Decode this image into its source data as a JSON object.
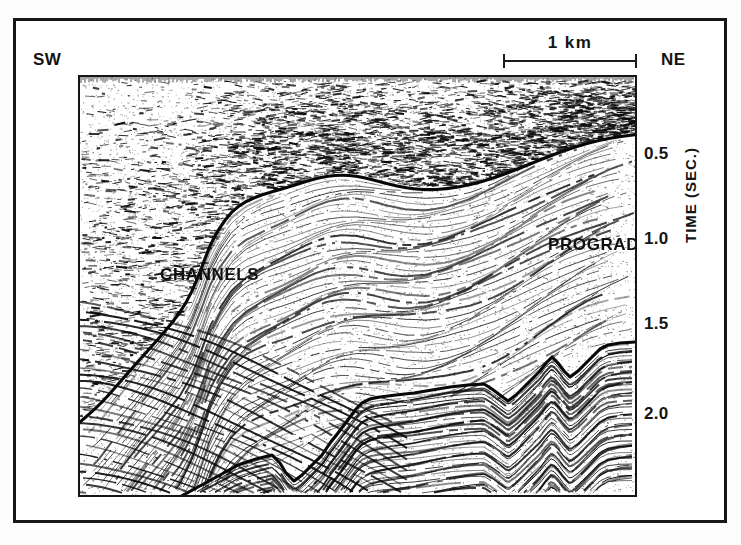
{
  "figure": {
    "type": "seismic-reflection-profile",
    "orientation": {
      "left_label": "SW",
      "right_label": "NE"
    },
    "scalebar": {
      "label": "1 km",
      "length_km": 1
    },
    "axis": {
      "title": "TIME (SEC.)",
      "unit": "SEC.",
      "ticks": [
        {
          "label": "0.5",
          "value": 0.5,
          "y": 80
        },
        {
          "label": "1.0",
          "value": 1.0,
          "y": 165
        },
        {
          "label": "1.5",
          "value": 1.5,
          "y": 250
        },
        {
          "label": "2.0",
          "value": 2.0,
          "y": 340
        }
      ]
    },
    "annotations": [
      {
        "label": "CHANNELS",
        "x": 2,
        "y": 113
      },
      {
        "label": "PROGRADING",
        "x": 390,
        "y": 83
      },
      {
        "label": "TURBIDITES",
        "x": 419,
        "y": 349
      }
    ],
    "horizons": [
      {
        "name": "upper-horizon",
        "style": "smooth",
        "points": [
          [
            0,
            345
          ],
          [
            18,
            330
          ],
          [
            40,
            305
          ],
          [
            62,
            280
          ],
          [
            82,
            258
          ],
          [
            100,
            236
          ],
          [
            112,
            215
          ],
          [
            122,
            190
          ],
          [
            130,
            168
          ],
          [
            140,
            150
          ],
          [
            152,
            134
          ],
          [
            166,
            124
          ],
          [
            184,
            117
          ],
          [
            202,
            112
          ],
          [
            218,
            107
          ],
          [
            234,
            102
          ],
          [
            248,
            99
          ],
          [
            262,
            98
          ],
          [
            276,
            99
          ],
          [
            290,
            102
          ],
          [
            308,
            107
          ],
          [
            326,
            111
          ],
          [
            346,
            113
          ],
          [
            366,
            112
          ],
          [
            390,
            108
          ],
          [
            414,
            101
          ],
          [
            438,
            92
          ],
          [
            462,
            82
          ],
          [
            486,
            73
          ],
          [
            508,
            66
          ],
          [
            530,
            61
          ],
          [
            552,
            58
          ],
          [
            559,
            57
          ]
        ]
      },
      {
        "name": "lower-horizon",
        "style": "zigzag",
        "points": [
          [
            96,
            422
          ],
          [
            118,
            410
          ],
          [
            140,
            398
          ],
          [
            158,
            388
          ],
          [
            176,
            382
          ],
          [
            192,
            378
          ],
          [
            200,
            386
          ],
          [
            206,
            396
          ],
          [
            214,
            404
          ],
          [
            222,
            398
          ],
          [
            232,
            388
          ],
          [
            242,
            378
          ],
          [
            250,
            366
          ],
          [
            258,
            356
          ],
          [
            264,
            348
          ],
          [
            270,
            340
          ],
          [
            276,
            332
          ],
          [
            282,
            326
          ],
          [
            290,
            322
          ],
          [
            300,
            320
          ],
          [
            316,
            318
          ],
          [
            334,
            316
          ],
          [
            352,
            313
          ],
          [
            370,
            310
          ],
          [
            388,
            308
          ],
          [
            404,
            307
          ],
          [
            412,
            312
          ],
          [
            420,
            318
          ],
          [
            428,
            324
          ],
          [
            436,
            318
          ],
          [
            444,
            310
          ],
          [
            452,
            302
          ],
          [
            460,
            294
          ],
          [
            466,
            286
          ],
          [
            472,
            280
          ],
          [
            478,
            286
          ],
          [
            484,
            294
          ],
          [
            490,
            300
          ],
          [
            498,
            294
          ],
          [
            506,
            286
          ],
          [
            514,
            278
          ],
          [
            520,
            272
          ],
          [
            528,
            268
          ],
          [
            540,
            266
          ],
          [
            556,
            265
          ],
          [
            559,
            265
          ]
        ]
      }
    ],
    "scan_artifact_text": "·  ·   ·  ·    ·   ·  ·     ·   ·  ·   ·     ·"
  }
}
